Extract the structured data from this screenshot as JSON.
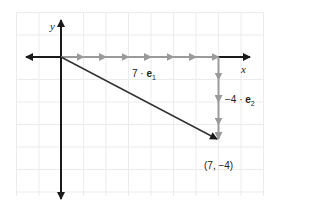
{
  "diagram": {
    "type": "vector-decomposition",
    "axes": {
      "x_label": "x",
      "y_label": "y"
    },
    "origin": [
      0,
      0
    ],
    "point": {
      "coords": [
        7,
        -4
      ],
      "label": "(7, −4)"
    },
    "components": [
      {
        "label_coef": "7 · ",
        "label_vec": "e",
        "label_sub": "1",
        "steps": 7,
        "direction": "x"
      },
      {
        "label_coef": "−4 · ",
        "label_vec": "e",
        "label_sub": "2",
        "steps": 4,
        "direction": "-y"
      }
    ],
    "colors": {
      "axis": "#1a1a1a",
      "component": "#9a9a9a",
      "grid": "#ececec",
      "resultant": "#333333"
    }
  }
}
